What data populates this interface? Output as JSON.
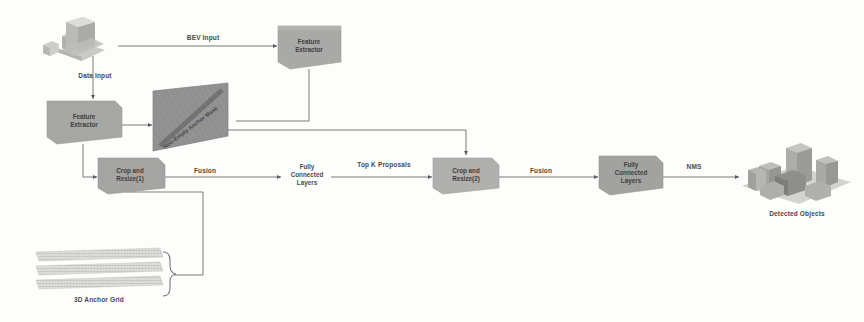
{
  "figure": {
    "domain": "diagram",
    "background_color": "#fdfdfc",
    "box_fill": "#a8a8a8",
    "box_fill_light": "#b4b4b4",
    "plane_fill": "#8f8f8f",
    "line_color": "#6b6b6b",
    "text_color": "#4a4a4a"
  },
  "nodes": {
    "bev_source": {
      "name": "bev-point-cloud-source"
    },
    "feature_extractor_top": {
      "line1": "Feature",
      "line2": "Extractor"
    },
    "feature_extractor_left": {
      "line1": "Feature",
      "line2": "Extractor"
    },
    "anchor_mask_plane": {
      "label": "Non-Empty Anchor Mask"
    },
    "crop_resize_1": {
      "line1": "Crop and",
      "line2": "Resize(1)"
    },
    "fc_layers_1": {
      "line1": "Fully",
      "line2": "Connected",
      "line3": "Layers"
    },
    "crop_resize_2": {
      "line1": "Crop and",
      "line2": "Resize(2)"
    },
    "fc_layers_2": {
      "line1": "Fully",
      "line2": "Connected",
      "line3": "Layers"
    },
    "anchor_grid": {
      "label": "3D Anchor Grid"
    },
    "detected_objects": {
      "label": "Detected Objects"
    }
  },
  "edges": {
    "bev_input": {
      "label": "BEV Input"
    },
    "data_input": {
      "label": "Data Input"
    },
    "fusion_1": {
      "label": "Fusion"
    },
    "top_k_proposals": {
      "label": "Top K Proposals"
    },
    "fusion_2": {
      "label": "Fusion"
    },
    "nms": {
      "label": "NMS"
    }
  }
}
